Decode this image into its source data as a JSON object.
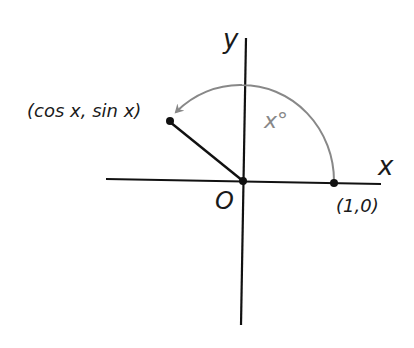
{
  "diagram": {
    "type": "unit-circle-angle",
    "axes": {
      "x_label": "x",
      "y_label": "y",
      "origin_label": "O"
    },
    "points": {
      "start": {
        "label": "(1,0)"
      },
      "terminal": {
        "label": "(cos x, sin x)"
      }
    },
    "angle": {
      "label": "x°"
    },
    "colors": {
      "axes": "#111111",
      "arc": "#888888",
      "text": "#1a1a1a"
    }
  }
}
